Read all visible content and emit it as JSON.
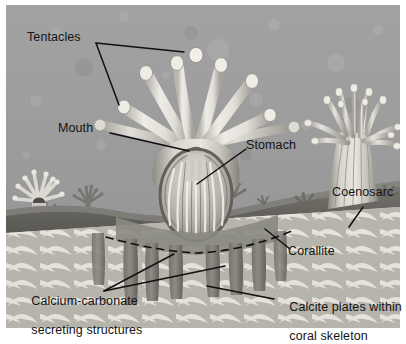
{
  "figure": {
    "frame": {
      "background": "#ffffff",
      "margin_px": 6
    }
  },
  "palette": {
    "water_top": "#9c9c9c",
    "water_bottom": "#8f8f8f",
    "tissue_light": "#e8e6e0",
    "tissue_mid": "#c9c6bf",
    "tissue_shadow": "#7d7a74",
    "coenosarc": "#6f6d69",
    "coenosarc_dark": "#5a5854",
    "skeleton_light": "#dedbd4",
    "skeleton_plate": "#cfccc4",
    "skeleton_gap": "#b7b4ac",
    "stomach_fill": "#b9b5ad",
    "stomach_rim": "#6a6762",
    "background_polyp": "#6b6965",
    "leader_line": "#101010",
    "label_text": "#141414",
    "dashed_line": "#1a1a1a"
  },
  "labels": [
    {
      "id": "tentacles",
      "text": "Tentacles",
      "lines": [
        "Tentacles"
      ],
      "x": 27,
      "y": 38,
      "anchor": "left",
      "leader_count": 2,
      "points_to": [
        "tentacle-tip-upper-right",
        "tentacle-tip-lower-left"
      ]
    },
    {
      "id": "mouth",
      "text": "Mouth",
      "lines": [
        "Mouth"
      ],
      "x": 58,
      "y": 122,
      "anchor": "left",
      "leader_count": 1,
      "points_to": [
        "oral-opening"
      ]
    },
    {
      "id": "stomach",
      "text": "Stomach",
      "lines": [
        "Stomach"
      ],
      "x": 246,
      "y": 139,
      "anchor": "left",
      "leader_count": 1,
      "points_to": [
        "gastric-cavity"
      ]
    },
    {
      "id": "coenosarc",
      "text": "Coenosarc",
      "lines": [
        "Coenosarc"
      ],
      "x": 332,
      "y": 192,
      "anchor": "left",
      "leader_count": 1,
      "points_to": [
        "connecting-tissue-band"
      ]
    },
    {
      "id": "corallite",
      "text": "Corallite",
      "lines": [
        "Corallite"
      ],
      "x": 288,
      "y": 245,
      "anchor": "left",
      "leader_count": 1,
      "points_to": [
        "corallite-cup"
      ]
    },
    {
      "id": "calcium-carbonate",
      "text": "Calcium-carbonate secreting structures",
      "lines": [
        "Calcium-carbonate",
        "secreting structures"
      ],
      "x": 17,
      "y": 286,
      "anchor": "left",
      "leader_count": 2,
      "points_to": [
        "septum-left",
        "septum-right"
      ]
    },
    {
      "id": "calcite-plates",
      "text": "Calcite plates within coral skeleton",
      "lines": [
        "Calcite plates within",
        "coral skeleton"
      ],
      "x": 275,
      "y": 292,
      "anchor": "left",
      "leader_count": 1,
      "points_to": [
        "skeleton-plate-row"
      ]
    }
  ],
  "anatomy": {
    "main_polyp": {
      "name": "central coral polyp",
      "tentacle_count": 8,
      "tentacle_shape": "club-shaped with knobbed tips",
      "has_mouth": true,
      "has_stomach": true,
      "septa_count": 6
    },
    "right_polyp": {
      "name": "neighbouring coral polyp",
      "tentacle_count": 12,
      "column": "striated"
    },
    "background_polyps": {
      "name": "silhouetted background polyps",
      "count": 6
    },
    "skeleton": {
      "name": "coral skeleton",
      "texture": "stacked calcite plate rows",
      "plate_rows": 13
    },
    "boundary": {
      "name": "tissue-skeleton boundary",
      "style": "dashed"
    }
  }
}
